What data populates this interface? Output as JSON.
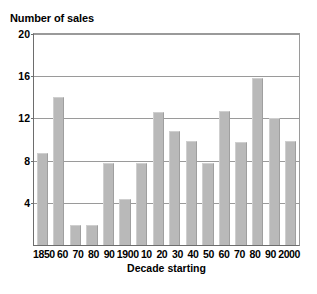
{
  "chart_data": {
    "type": "bar",
    "title": "",
    "ylabel": "Number of sales",
    "xlabel": "Decade starting",
    "categories": [
      "1850",
      "60",
      "70",
      "80",
      "90",
      "1900",
      "10",
      "20",
      "30",
      "40",
      "50",
      "60",
      "70",
      "80",
      "90",
      "2000"
    ],
    "values": [
      8.7,
      14.0,
      1.9,
      1.9,
      7.8,
      4.4,
      7.8,
      12.6,
      10.8,
      9.9,
      7.8,
      12.7,
      9.8,
      15.8,
      12.0,
      9.9
    ],
    "ylim": [
      0,
      20
    ],
    "y_ticks": [
      0,
      4,
      8,
      12,
      16,
      20
    ],
    "y_tick_labels": [
      "",
      "4",
      "8",
      "12",
      "16",
      "20"
    ],
    "grid": true,
    "legend": false,
    "bar_color": "#b9b9b9",
    "axis_color": "#6d6d6d",
    "grid_color": "#9a9a9a"
  }
}
